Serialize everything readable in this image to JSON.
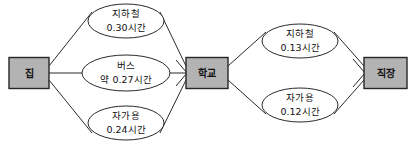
{
  "diagram": {
    "type": "network-flow-diagram",
    "title": "",
    "colors": {
      "node_fill": "#b3b3b3",
      "node_border": "#262626",
      "edge_stroke": "#2a2a2a",
      "ellipse_fill": "#ffffff",
      "background": "#ffffff",
      "text": "#111111"
    },
    "nodes": [
      {
        "id": "home",
        "label": "집",
        "x": 29,
        "y": 73,
        "w": 40,
        "h": 31
      },
      {
        "id": "school",
        "label": "학교",
        "x": 207,
        "y": 73,
        "w": 42,
        "h": 31
      },
      {
        "id": "workplace",
        "label": "직장",
        "x": 385,
        "y": 73,
        "w": 43,
        "h": 31
      }
    ],
    "edges": [
      {
        "id": "home-school-subway",
        "from": "home",
        "to": "school",
        "mode": "지하철",
        "time": "0.30시간",
        "value": 0.3,
        "unit": "시간",
        "cx": 126,
        "cy": 21,
        "rx": 38,
        "ry": 17
      },
      {
        "id": "home-school-bus",
        "from": "home",
        "to": "school",
        "mode": "버스",
        "time": "약 0.27시간",
        "value": 0.27,
        "unit": "시간",
        "approximate": true,
        "cx": 126,
        "cy": 73,
        "rx": 44,
        "ry": 18
      },
      {
        "id": "home-school-car",
        "from": "home",
        "to": "school",
        "mode": "자가용",
        "time": "0.24시간",
        "value": 0.24,
        "unit": "시간",
        "cx": 126,
        "cy": 123,
        "rx": 38,
        "ry": 17
      },
      {
        "id": "school-work-subway",
        "from": "school",
        "to": "workplace",
        "mode": "지하철",
        "time": "0.13시간",
        "value": 0.13,
        "unit": "시간",
        "cx": 300,
        "cy": 41,
        "rx": 38,
        "ry": 17
      },
      {
        "id": "school-work-car",
        "from": "school",
        "to": "workplace",
        "mode": "자가용",
        "time": "0.12시간",
        "value": 0.12,
        "unit": "시간",
        "cx": 300,
        "cy": 105,
        "rx": 38,
        "ry": 17
      }
    ]
  }
}
